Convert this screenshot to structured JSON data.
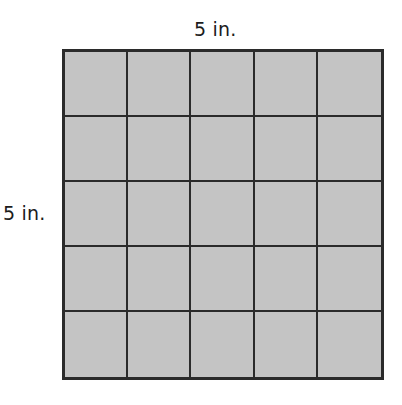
{
  "diagram": {
    "type": "area-grid",
    "top_label": "5 in.",
    "side_label": "5 in.",
    "rows": 5,
    "columns": 5,
    "cell_fill_color": "#c4c4c4",
    "line_color": "#2b2b2b"
  }
}
